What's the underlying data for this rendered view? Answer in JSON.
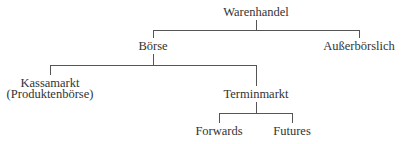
{
  "diagram": {
    "type": "tree",
    "nodes": {
      "root": {
        "label": "Warenhandel"
      },
      "boerse": {
        "label": "Börse"
      },
      "ausserboerslich": {
        "label": "Außerbörslich"
      },
      "kassamarkt": {
        "label": "Kassamarkt",
        "sublabel": "(Produktenbörse)"
      },
      "terminmarkt": {
        "label": "Terminmarkt"
      },
      "forwards": {
        "label": "Forwards"
      },
      "futures": {
        "label": "Futures"
      }
    },
    "edges": [
      {
        "from": "root",
        "to": "boerse"
      },
      {
        "from": "root",
        "to": "ausserboerslich"
      },
      {
        "from": "boerse",
        "to": "kassamarkt"
      },
      {
        "from": "boerse",
        "to": "terminmarkt"
      },
      {
        "from": "terminmarkt",
        "to": "forwards"
      },
      {
        "from": "terminmarkt",
        "to": "futures"
      }
    ],
    "colors": {
      "text": "#333333",
      "lines": "#555555",
      "background": "#ffffff"
    }
  }
}
